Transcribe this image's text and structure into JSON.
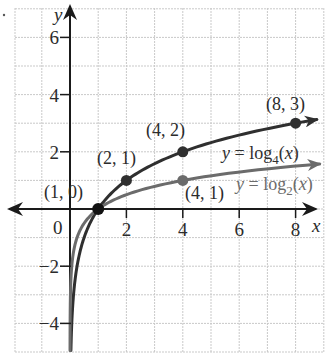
{
  "chart_data": {
    "type": "line",
    "title": "",
    "xlabel": "x",
    "ylabel": "y",
    "xlim": [
      -2,
      9
    ],
    "ylim": [
      -5,
      7
    ],
    "grid": true,
    "x_ticks": [
      {
        "value": 2,
        "label": "2"
      },
      {
        "value": 4,
        "label": "4"
      },
      {
        "value": 6,
        "label": "6"
      },
      {
        "value": 8,
        "label": "8"
      }
    ],
    "y_ticks": [
      {
        "value": 6,
        "label": "6"
      },
      {
        "value": 4,
        "label": "4"
      },
      {
        "value": 2,
        "label": "2"
      },
      {
        "value": -2,
        "label": "−2"
      },
      {
        "value": -4,
        "label": "−4"
      }
    ],
    "origin_label": "0",
    "series": [
      {
        "name": "y = log4(x)",
        "label_prefix": "y = log",
        "label_base": "4",
        "label_suffix": "(x)",
        "color": "#2f2f2f",
        "base": 2,
        "points": [
          {
            "x": 1,
            "y": 0,
            "label": "(1, 0)"
          },
          {
            "x": 2,
            "y": 1,
            "label": "(2, 1)"
          },
          {
            "x": 4,
            "y": 2,
            "label": "(4, 2)"
          },
          {
            "x": 8,
            "y": 3,
            "label": "(8, 3)"
          }
        ]
      },
      {
        "name": "y = log2(x)",
        "label_prefix": "y = log",
        "label_base": "2",
        "label_suffix": "(x)",
        "color": "#6b6b6b",
        "base": 4,
        "points": [
          {
            "x": 4,
            "y": 1,
            "label": "(4, 1)"
          }
        ]
      }
    ]
  }
}
